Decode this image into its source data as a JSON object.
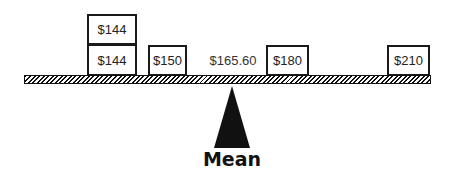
{
  "diagram": {
    "type": "balance-scale",
    "values": [
      {
        "label": "$144",
        "amount": 144,
        "stack": 2
      },
      {
        "label": "$144",
        "amount": 144,
        "stack": 1
      },
      {
        "label": "$150",
        "amount": 150,
        "stack": 1
      },
      {
        "label": "$180",
        "amount": 180,
        "stack": 1
      },
      {
        "label": "$210",
        "amount": 210,
        "stack": 1
      }
    ],
    "mean_value_label": "$165.60",
    "mean_value": 165.6,
    "fulcrum_label": "Mean"
  },
  "colors": {
    "ink": "#111111",
    "background": "#ffffff"
  }
}
